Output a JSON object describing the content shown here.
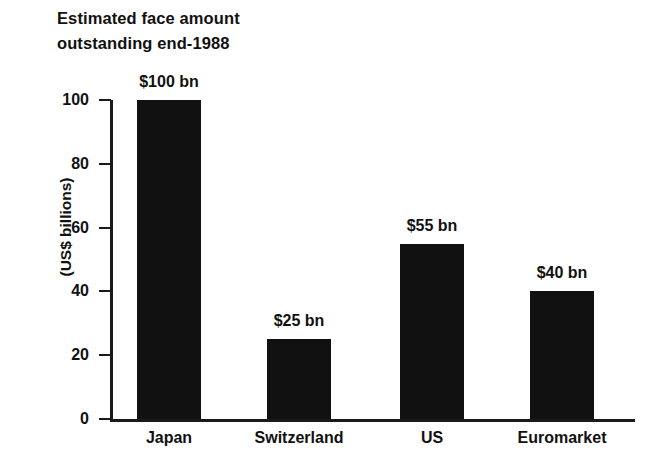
{
  "chart_data": {
    "type": "bar",
    "title": "Estimated face amount\noutstanding end-1988",
    "xlabel": "",
    "ylabel": "(US$ billions)",
    "ylim": [
      0,
      100
    ],
    "yticks": [
      "0",
      "20",
      "40",
      "60",
      "80",
      "100"
    ],
    "ytick_values": [
      0,
      20,
      40,
      60,
      80,
      100
    ],
    "grid": false,
    "legend": "none",
    "bar_color": "#111111",
    "categories": [
      "Japan",
      "Switzerland",
      "US",
      "Euromarket"
    ],
    "values": [
      100,
      25,
      55,
      40
    ],
    "data_labels": [
      "$100 bn",
      "$25 bn",
      "$55 bn",
      "$40 bn"
    ]
  }
}
